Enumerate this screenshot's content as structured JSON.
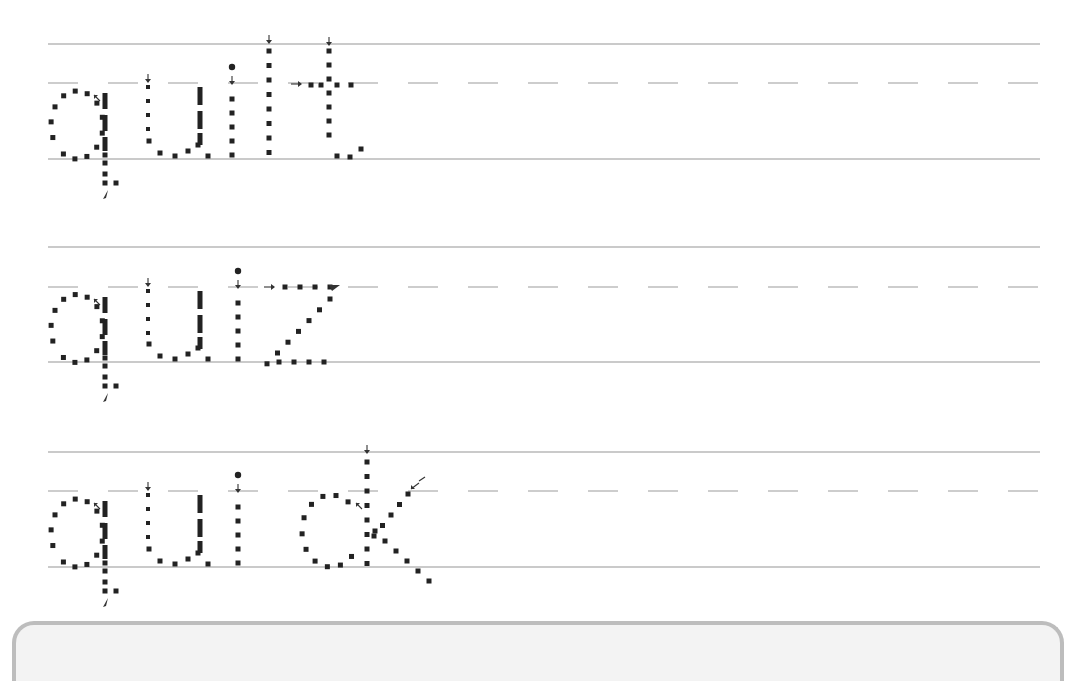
{
  "worksheet": {
    "type": "handwriting tracing practice",
    "words": [
      {
        "text": "quilt",
        "row": 0
      },
      {
        "text": "quiz",
        "row": 1
      },
      {
        "text": "quick",
        "row": 2
      }
    ],
    "rows": [
      {
        "top": 44,
        "mid": 83,
        "base": 159
      },
      {
        "top": 247,
        "mid": 287,
        "base": 362
      },
      {
        "top": 452,
        "mid": 491,
        "base": 567
      }
    ],
    "lines": {
      "x_start": 48,
      "x_end": 1040,
      "dash_len": 30,
      "dash_gap": 30
    },
    "colors": {
      "guide": "#b8b8b8",
      "dots": "#222222",
      "box_border": "#bdbdbd",
      "box_fill": "#f3f3f3"
    }
  }
}
